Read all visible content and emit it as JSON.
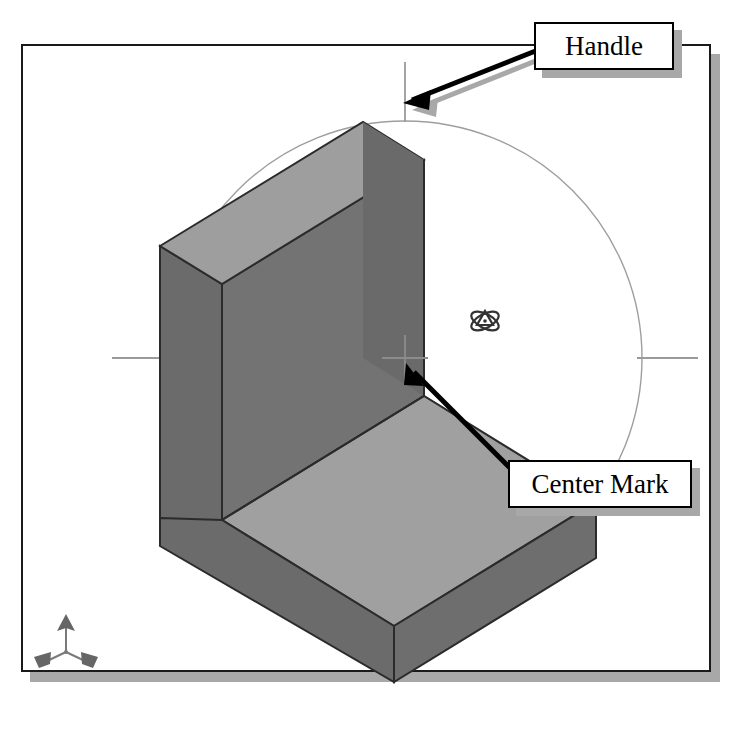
{
  "app": {
    "view_label": "3D isometric viewport",
    "background_color": "#ffffff",
    "frame_border_color": "#1a1a1a",
    "frame_shadow_color": "#a8a8a8"
  },
  "callouts": [
    {
      "id": "handle",
      "label": "Handle",
      "points_to": "rotation-ring-handle",
      "box_fill": "#ffffff",
      "box_border": "#000000",
      "shadow": "#a8a8a8"
    },
    {
      "id": "center-mark",
      "label": "Center Mark",
      "points_to": "rotation-center-crosshair",
      "box_fill": "#ffffff",
      "box_border": "#000000",
      "shadow": "#a8a8a8"
    }
  ],
  "rotation_ring": {
    "center_x": 405,
    "center_y": 358,
    "radius": 237,
    "stroke_color": "#9b9b9b",
    "handles": [
      {
        "name": "handle-top",
        "position": "top"
      },
      {
        "name": "handle-right",
        "position": "right"
      },
      {
        "name": "handle-bottom",
        "position": "bottom"
      },
      {
        "name": "handle-left",
        "position": "left"
      }
    ],
    "center_mark": {
      "name": "center-crosshair",
      "x": 405,
      "y": 358,
      "size": 46,
      "color": "#8c8c8c"
    }
  },
  "solid": {
    "name": "l-shaped-block",
    "face_colors": {
      "top_light": "#9d9d9d",
      "front_dark": "#6f6f6f",
      "side_dark": "#6a6a6a",
      "outline": "#2b2b2b"
    }
  },
  "icons": {
    "axis_triad": {
      "name": "axis-triad-icon",
      "color": "#6a6a6a",
      "axes": [
        "z-up",
        "x-left",
        "y-right"
      ]
    },
    "rotate_cursor": {
      "name": "rotate-orbit-cursor-icon",
      "color": "#3a3a3a"
    }
  }
}
